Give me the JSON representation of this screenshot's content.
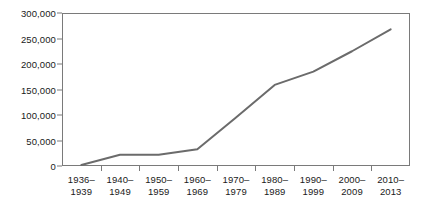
{
  "chart_data": {
    "type": "line",
    "title": "",
    "subtitle": "",
    "xlabel": "",
    "ylabel": "",
    "categories": [
      "1936–1939",
      "1940–1949",
      "1950–1959",
      "1960–1969",
      "1970–1979",
      "1980–1989",
      "1990–1999",
      "2000–2009",
      "2010–2013"
    ],
    "values": [
      2000,
      22000,
      22000,
      33000,
      95000,
      159000,
      185000,
      225000,
      268000
    ],
    "series": [
      {
        "name": "",
        "values": [
          2000,
          22000,
          22000,
          33000,
          95000,
          159000,
          185000,
          225000,
          268000
        ],
        "color": "#6b6b6b"
      }
    ],
    "ylim": [
      0,
      300000
    ],
    "ytick_values": [
      0,
      50000,
      100000,
      150000,
      200000,
      250000,
      300000
    ],
    "ytick_labels": [
      "0",
      "50,000",
      "100,000",
      "150,000",
      "200,000",
      "250,000",
      "300,000"
    ],
    "grid": false,
    "legend": false,
    "legend_position": "none",
    "axis_color": "#7a7a7a",
    "text_color": "#1a1a1a",
    "background_color": "#ffffff"
  }
}
